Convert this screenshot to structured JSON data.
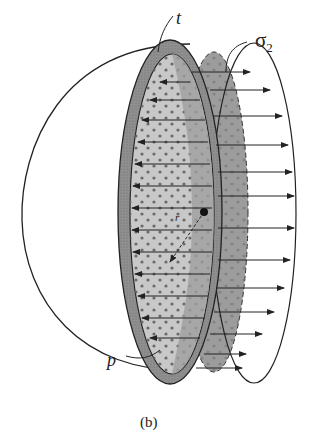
{
  "figure": {
    "labels": {
      "thickness": "t",
      "stress_symbol": "σ",
      "stress_subscript": "2",
      "pressure": "p",
      "radius": "r"
    },
    "caption": "(b)"
  },
  "colors": {
    "outline": "#222222",
    "wall_fill": "#8f8f8f",
    "inner_face_fill": "#c8c8c8",
    "stress_face_fill": "#9c9c9c",
    "dot": "#6a6a6a",
    "background": "#ffffff"
  }
}
